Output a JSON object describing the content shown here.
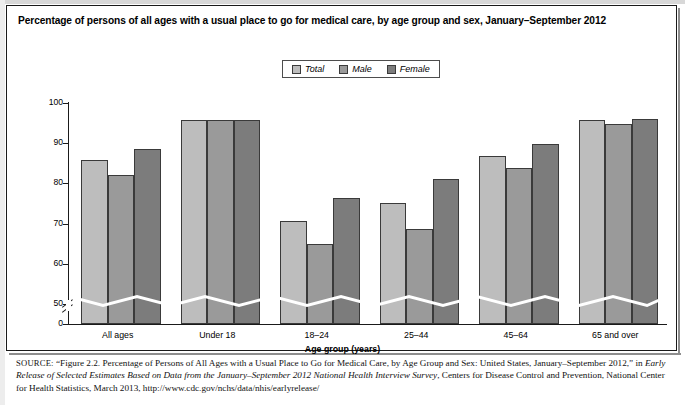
{
  "chart_data": {
    "type": "bar",
    "title": "Percentage of persons of all ages with a usual place to go for medical care, by age group and sex, January–September 2012",
    "xlabel": "Age group (years)",
    "ylabel": "Percent",
    "categories": [
      "All ages",
      "Under 18",
      "18–24",
      "25–44",
      "45–64",
      "65 and over"
    ],
    "series": [
      {
        "name": "Total",
        "color": "#bdbdbd",
        "values": [
          85.8,
          95.7,
          70.7,
          75.2,
          86.9,
          95.8
        ]
      },
      {
        "name": "Male",
        "color": "#9a9a9a",
        "values": [
          82.1,
          95.7,
          65.0,
          68.7,
          83.9,
          94.7
        ]
      },
      {
        "name": "Female",
        "color": "#7c7c7c",
        "values": [
          88.6,
          95.7,
          76.3,
          81.2,
          89.8,
          96.0
        ]
      }
    ],
    "ylim": [
      0,
      100
    ],
    "yticks": [
      0,
      50,
      60,
      70,
      80,
      90,
      100
    ],
    "ytick_labels": [
      "0",
      "50",
      "60",
      "70",
      "80",
      "90",
      "100"
    ],
    "axis_break": true,
    "axis_break_note": "y-axis broken between 0 and 50",
    "grid": false,
    "legend_position": "top-center",
    "legend_entries": [
      "Total",
      "Male",
      "Female"
    ]
  },
  "legend": {
    "items": [
      {
        "label": "Total"
      },
      {
        "label": "Male"
      },
      {
        "label": "Female"
      }
    ]
  },
  "axis": {
    "y_title": "Percent",
    "x_title": "Age group (years)"
  },
  "source": {
    "prefix": "SOURCE:",
    "text_1": "“Figure 2.2. Percentage of Persons of All Ages with a Usual Place to Go for Medical Care, by Age Group and Sex: United States, January–September 2012,” in ",
    "italic_1": "Early Release of Selected Estimates Based on Data from the January–September 2012 National Health Interview Survey",
    "text_2": ", Centers for Disease Control and Prevention, National Center for Health Statistics, March 2013, http://www.cdc.gov/nchs/data/nhis/earlyrelease/"
  }
}
